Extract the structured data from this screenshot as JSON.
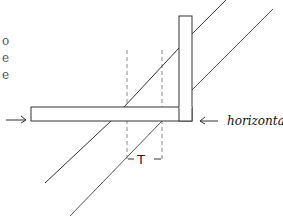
{
  "diagram": {
    "side_text": [
      "o",
      "e",
      "e"
    ],
    "labels": {
      "thickness": "T",
      "horizontal": "horizontal"
    },
    "colors": {
      "stroke": "#333333",
      "dashed": "#888888",
      "background": "#ffffff"
    },
    "shapes": {
      "horizontal_bar": {
        "x": 31,
        "y": 107,
        "w": 161,
        "h": 14
      },
      "vertical_bar": {
        "x": 179,
        "y": 16,
        "w": 13,
        "h": 105
      },
      "dashed_lines_x": [
        127,
        162
      ],
      "diagonal_lines": [
        {
          "from": [
            45,
            183
          ],
          "to": [
            226,
            0
          ]
        },
        {
          "from": [
            70,
            216
          ],
          "to": [
            273,
            9
          ]
        }
      ],
      "arrows": [
        "left-arrow-into-bar",
        "arrow-pointing-to-bar-from-horizontal-label"
      ]
    }
  }
}
